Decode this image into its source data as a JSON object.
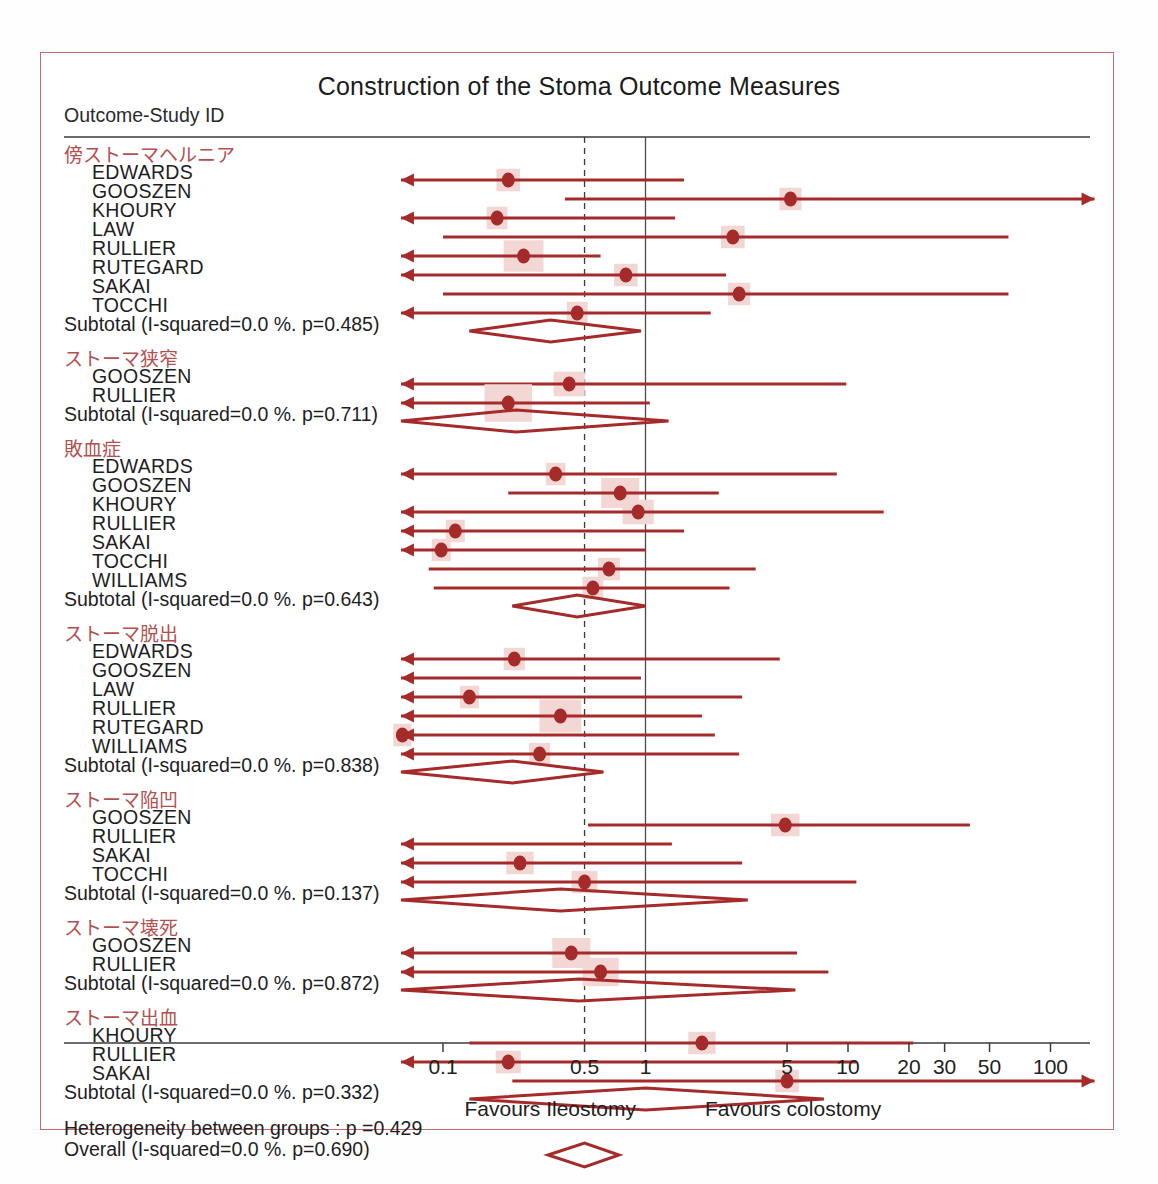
{
  "figure": {
    "title": "Construction of the Stoma Outcome Measures",
    "column_header": "Outcome-Study ID",
    "heterogeneity_note": "Heterogeneity between groups : p =0.429",
    "overall_label": "Overall (I-squared=0.0 %. p=0.690)",
    "favours_left": "Favours Ileostomy",
    "favours_right": "Favours colostomy",
    "accent_color": "#a52a2a",
    "group_header_color": "#b4504f",
    "box_fill_color": "#f2d7d5",
    "frame_color": "#c36a68"
  },
  "chart_data": {
    "type": "forest",
    "title": "Construction of the Stoma Outcome Measures",
    "xlabel": "",
    "ylabel": "",
    "xscale": "log",
    "xlim": [
      0.055,
      190
    ],
    "null_line": 1,
    "pooled_line": 0.5,
    "grid": false,
    "legend": "none",
    "x_ticks": [
      0.1,
      0.5,
      1,
      5,
      10,
      20,
      30,
      50,
      100
    ],
    "x_tick_labels": [
      "0.1",
      "0.5",
      "1",
      "5",
      "10",
      "20",
      "30",
      "50",
      "100"
    ],
    "effect_measure": "Odds ratio",
    "left_arrow_limit": 0.062,
    "right_arrow_limit": 165,
    "groups": [
      {
        "label": "傍ストーマヘルニア",
        "subtotal_label": "Subtotal (I-squared=0.0 %. p=0.485)",
        "subtotal": {
          "est": 0.34,
          "lo": 0.135,
          "hi": 0.95
        },
        "studies": [
          {
            "name": "EDWARDS",
            "est": 0.21,
            "lo": 0.045,
            "hi": 1.55,
            "left_arrow": true,
            "right_arrow": false,
            "box": 0.62
          },
          {
            "name": "GOOSZEN",
            "est": 5.2,
            "lo": 0.4,
            "hi": 170,
            "left_arrow": false,
            "right_arrow": true,
            "box": 0.58
          },
          {
            "name": "KHOURY",
            "est": 0.185,
            "lo": 0.048,
            "hi": 1.4,
            "left_arrow": true,
            "right_arrow": false,
            "box": 0.55
          },
          {
            "name": "LAW",
            "est": 2.7,
            "lo": 0.1,
            "hi": 62,
            "left_arrow": false,
            "right_arrow": false,
            "box": 0.62
          },
          {
            "name": "RULLIER",
            "est": 0.25,
            "lo": 0.045,
            "hi": 0.6,
            "left_arrow": true,
            "right_arrow": false,
            "box": 1.05
          },
          {
            "name": "RUTEGARD",
            "est": 0.8,
            "lo": 0.045,
            "hi": 2.5,
            "left_arrow": true,
            "right_arrow": false,
            "box": 0.62
          },
          {
            "name": "SAKAI",
            "est": 2.9,
            "lo": 0.1,
            "hi": 62,
            "left_arrow": false,
            "right_arrow": false,
            "box": 0.58
          },
          {
            "name": "TOCCHI",
            "est": 0.46,
            "lo": 0.045,
            "hi": 2.1,
            "left_arrow": true,
            "right_arrow": false,
            "box": 0.55
          }
        ]
      },
      {
        "label": "ストーマ狭窄",
        "subtotal_label": "Subtotal (I-squared=0.0 %. p=0.711)",
        "subtotal": {
          "est": 0.23,
          "lo": 0.055,
          "hi": 1.3
        },
        "studies": [
          {
            "name": "GOOSZEN",
            "est": 0.42,
            "lo": 0.05,
            "hi": 9.8,
            "left_arrow": true,
            "right_arrow": false,
            "box": 0.82
          },
          {
            "name": "RULLIER",
            "est": 0.21,
            "lo": 0.05,
            "hi": 1.05,
            "left_arrow": true,
            "right_arrow": false,
            "box": 1.25
          }
        ]
      },
      {
        "label": "敗血症",
        "subtotal_label": "Subtotal (I-squared=0.0 %. p=0.643)",
        "subtotal": {
          "est": 0.46,
          "lo": 0.22,
          "hi": 1.0
        },
        "studies": [
          {
            "name": "EDWARDS",
            "est": 0.36,
            "lo": 0.05,
            "hi": 8.8,
            "left_arrow": true,
            "right_arrow": false,
            "box": 0.52
          },
          {
            "name": "GOOSZEN",
            "est": 0.75,
            "lo": 0.21,
            "hi": 2.3,
            "left_arrow": false,
            "right_arrow": false,
            "box": 1.0
          },
          {
            "name": "KHOURY",
            "est": 0.92,
            "lo": 0.05,
            "hi": 15,
            "left_arrow": true,
            "right_arrow": false,
            "box": 0.82
          },
          {
            "name": "RULLIER",
            "est": 0.115,
            "lo": 0.048,
            "hi": 1.55,
            "left_arrow": true,
            "right_arrow": false,
            "box": 0.5
          },
          {
            "name": "SAKAI",
            "est": 0.098,
            "lo": 0.048,
            "hi": 1.0,
            "left_arrow": true,
            "right_arrow": false,
            "box": 0.5
          },
          {
            "name": "TOCCHI",
            "est": 0.66,
            "lo": 0.085,
            "hi": 3.5,
            "left_arrow": false,
            "right_arrow": false,
            "box": 0.58
          },
          {
            "name": "WILLIAMS",
            "est": 0.55,
            "lo": 0.09,
            "hi": 2.6,
            "left_arrow": false,
            "right_arrow": false,
            "box": 0.55
          }
        ]
      },
      {
        "label": "ストーマ脱出",
        "subtotal_label": "Subtotal (I-squared=0.0 %. p=0.838)",
        "subtotal": {
          "est": 0.22,
          "lo": 0.055,
          "hi": 0.62
        },
        "studies": [
          {
            "name": "EDWARDS",
            "est": 0.225,
            "lo": 0.05,
            "hi": 4.6,
            "left_arrow": true,
            "right_arrow": false,
            "box": 0.56
          },
          {
            "name": "GOOSZEN",
            "est": 0.085,
            "lo": 0.05,
            "hi": 0.95,
            "left_arrow": true,
            "right_arrow": false,
            "box": 0.0
          },
          {
            "name": "LAW",
            "est": 0.135,
            "lo": 0.05,
            "hi": 3.0,
            "left_arrow": true,
            "right_arrow": false,
            "box": 0.5
          },
          {
            "name": "RULLIER",
            "est": 0.38,
            "lo": 0.05,
            "hi": 1.9,
            "left_arrow": true,
            "right_arrow": false,
            "box": 1.1
          },
          {
            "name": "RUTEGARD",
            "est": 0.063,
            "lo": 0.05,
            "hi": 2.2,
            "left_arrow": true,
            "right_arrow": false,
            "box": 0.48
          },
          {
            "name": "WILLIAMS",
            "est": 0.3,
            "lo": 0.05,
            "hi": 2.9,
            "left_arrow": true,
            "right_arrow": false,
            "box": 0.55
          }
        ]
      },
      {
        "label": "ストーマ陥凹",
        "subtotal_label": "Subtotal (I-squared=0.0 %. p=0.137)",
        "subtotal": {
          "est": 0.38,
          "lo": 0.055,
          "hi": 3.2
        },
        "studies": [
          {
            "name": "GOOSZEN",
            "est": 4.9,
            "lo": 0.52,
            "hi": 40,
            "left_arrow": false,
            "right_arrow": false,
            "box": 0.75
          },
          {
            "name": "RULLIER",
            "est": 0.13,
            "lo": 0.05,
            "hi": 1.35,
            "left_arrow": true,
            "right_arrow": false,
            "box": 0.0
          },
          {
            "name": "SAKAI",
            "est": 0.24,
            "lo": 0.05,
            "hi": 3.0,
            "left_arrow": true,
            "right_arrow": false,
            "box": 0.72
          },
          {
            "name": "TOCCHI",
            "est": 0.5,
            "lo": 0.05,
            "hi": 11,
            "left_arrow": true,
            "right_arrow": false,
            "box": 0.68
          }
        ]
      },
      {
        "label": "ストーマ壊死",
        "subtotal_label": "Subtotal (I-squared=0.0 %. p=0.872)",
        "subtotal": {
          "est": 0.47,
          "lo": 0.055,
          "hi": 5.5
        },
        "studies": [
          {
            "name": "GOOSZEN",
            "est": 0.43,
            "lo": 0.05,
            "hi": 5.6,
            "left_arrow": true,
            "right_arrow": false,
            "box": 1.0
          },
          {
            "name": "RULLIER",
            "est": 0.6,
            "lo": 0.05,
            "hi": 8.0,
            "left_arrow": true,
            "right_arrow": false,
            "box": 0.95
          }
        ]
      },
      {
        "label": "ストーマ出血",
        "subtotal_label": "Subtotal (I-squared=0.0 %. p=0.332)",
        "subtotal": {
          "est": 1.0,
          "lo": 0.135,
          "hi": 7.6
        },
        "studies": [
          {
            "name": "KHOURY",
            "est": 1.9,
            "lo": 0.135,
            "hi": 21,
            "left_arrow": false,
            "right_arrow": false,
            "box": 0.72
          },
          {
            "name": "RULLIER",
            "est": 0.21,
            "lo": 0.05,
            "hi": 11,
            "left_arrow": true,
            "right_arrow": false,
            "box": 0.66
          },
          {
            "name": "SAKAI",
            "est": 5.0,
            "lo": 0.22,
            "hi": 165,
            "left_arrow": false,
            "right_arrow": true,
            "box": 0.62
          }
        ]
      }
    ],
    "overall": {
      "label": "Overall (I-squared=0.0 %. p=0.690)",
      "est": 0.5,
      "lo": 0.33,
      "hi": 0.74
    }
  }
}
